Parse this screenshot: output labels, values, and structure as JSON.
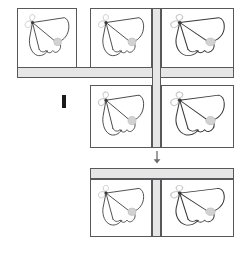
{
  "figure": {
    "type": "image-tiling-diagram",
    "background_color": "#ffffff",
    "stroke_color": "#58585a",
    "bar_color": "#e6e6e6",
    "marker_color": "#1a1a1a"
  },
  "labels": {
    "operator": "I",
    "arrow": "down-arrow",
    "arrow_glyph": "↓"
  },
  "groups": [
    {
      "id": "source-group",
      "name": "source tile arrangement",
      "tiles": [
        {
          "id": "tile-1",
          "name": "moth-tile-top-left",
          "row": 1,
          "col": 1
        },
        {
          "id": "tile-2",
          "name": "moth-tile-top-middle",
          "row": 1,
          "col": 2
        },
        {
          "id": "tile-3",
          "name": "moth-tile-top-right",
          "row": 1,
          "col": 3
        },
        {
          "id": "tile-4",
          "name": "moth-tile-bottom-middle",
          "row": 2,
          "col": 2
        },
        {
          "id": "tile-5",
          "name": "moth-tile-bottom-right",
          "row": 2,
          "col": 3
        }
      ],
      "bars": [
        {
          "id": "bar-h-upper",
          "name": "horizontal-seam-bar",
          "orientation": "horizontal"
        },
        {
          "id": "bar-v-main",
          "name": "vertical-seam-bar",
          "orientation": "vertical"
        }
      ]
    },
    {
      "id": "result-group",
      "name": "result tile arrangement",
      "tiles": [
        {
          "id": "tile-6",
          "name": "moth-tile-result-left",
          "row": 1,
          "col": 1
        },
        {
          "id": "tile-7",
          "name": "moth-tile-result-right",
          "row": 1,
          "col": 2
        }
      ],
      "bars": [
        {
          "id": "bar-h-result",
          "name": "horizontal-seam-bar",
          "orientation": "horizontal"
        },
        {
          "id": "bar-v-result",
          "name": "vertical-seam-bar",
          "orientation": "vertical"
        }
      ]
    }
  ],
  "specimen": {
    "subject": "moth",
    "wing_outline_color": "#3a3a3a",
    "antenna_color": "#c9c9c9",
    "spot_color": "#cccccc",
    "spot_name": "wing-spot"
  }
}
